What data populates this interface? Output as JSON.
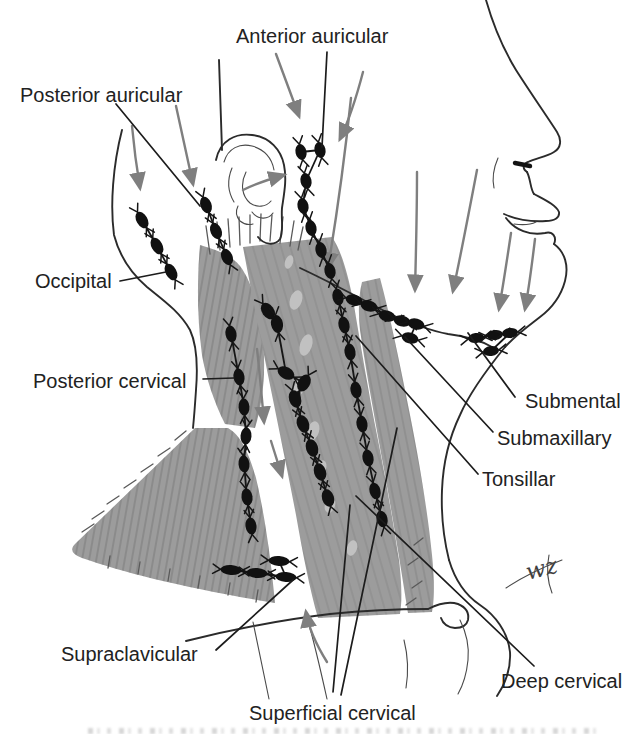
{
  "labels": [
    {
      "id": "anterior-auricular",
      "text": "Anterior auricular"
    },
    {
      "id": "posterior-auricular",
      "text": "Posterior auricular"
    },
    {
      "id": "occipital",
      "text": "Occipital"
    },
    {
      "id": "posterior-cervical",
      "text": "Posterior cervical"
    },
    {
      "id": "submental",
      "text": "Submental"
    },
    {
      "id": "submaxillary",
      "text": "Submaxillary"
    },
    {
      "id": "tonsillar",
      "text": "Tonsillar"
    },
    {
      "id": "supraclavicular",
      "text": "Supraclavicular"
    },
    {
      "id": "deep-cervical",
      "text": "Deep cervical"
    },
    {
      "id": "superficial-cervical",
      "text": "Superficial cervical"
    }
  ],
  "signature": "wz",
  "colors": {
    "background": "#ffffff",
    "line": "#2b2b2b",
    "muscle": "#9c9c9c",
    "muscle_hatch": "#565656",
    "node": "#111111",
    "arrow": "#7f7f7f",
    "label_text": "#222222",
    "speckle": "#c6c6c6"
  },
  "node_chains": [
    {
      "name": "occipital",
      "rx": 9,
      "ry": 5.5,
      "nodes": [
        [
          142,
          220
        ],
        [
          157,
          246
        ],
        [
          171,
          272
        ]
      ]
    },
    {
      "name": "posterior-auricular",
      "rx": 8.5,
      "ry": 5.5,
      "nodes": [
        [
          206,
          205
        ],
        [
          216,
          231
        ],
        [
          227,
          257
        ]
      ]
    },
    {
      "name": "anterior-auricular",
      "rx": 8,
      "ry": 5.5,
      "angle": 78,
      "nodes": [
        [
          301,
          152
        ],
        [
          320,
          150
        ],
        [
          306,
          181
        ],
        [
          303,
          206
        ],
        [
          311,
          228
        ],
        [
          321,
          250
        ],
        [
          330,
          271
        ]
      ]
    },
    {
      "name": "posterior-cervical",
      "rx": 8.5,
      "ry": 5.5,
      "nodes": [
        [
          231,
          334
        ],
        [
          239,
          377
        ],
        [
          244,
          407
        ],
        [
          246,
          436
        ],
        [
          244,
          464
        ],
        [
          247,
          497
        ],
        [
          251,
          526
        ]
      ]
    },
    {
      "name": "superficial-cervical",
      "rx": 9,
      "ry": 6,
      "nodes": [
        [
          268,
          311
        ],
        [
          277,
          324
        ],
        [
          286,
          373
        ],
        [
          304,
          383
        ],
        [
          295,
          399
        ],
        [
          303,
          424
        ],
        [
          312,
          448
        ],
        [
          320,
          472
        ],
        [
          328,
          498
        ]
      ]
    },
    {
      "name": "deep-cervical",
      "rx": 8.5,
      "ry": 5.5,
      "nodes": [
        [
          338,
          297
        ],
        [
          344,
          325
        ],
        [
          350,
          352
        ],
        [
          356,
          390
        ],
        [
          362,
          424
        ],
        [
          368,
          458
        ],
        [
          375,
          491
        ],
        [
          382,
          519
        ]
      ]
    },
    {
      "name": "submaxillary",
      "rx": 8.5,
      "ry": 5.5,
      "angle": 15,
      "nodes": [
        [
          354,
          300
        ],
        [
          369,
          306
        ],
        [
          387,
          316
        ],
        [
          402,
          321
        ],
        [
          416,
          324
        ],
        [
          410,
          338
        ]
      ]
    },
    {
      "name": "submental",
      "rx": 8,
      "ry": 5,
      "angle": -8,
      "nodes": [
        [
          476,
          338
        ],
        [
          495,
          335
        ],
        [
          510,
          333
        ],
        [
          491,
          351
        ]
      ]
    },
    {
      "name": "supraclavicular",
      "rx": 10.5,
      "ry": 5,
      "angle": 4,
      "nodes": [
        [
          231,
          570
        ],
        [
          257,
          573
        ],
        [
          286,
          577
        ],
        [
          279,
          561
        ]
      ]
    }
  ]
}
